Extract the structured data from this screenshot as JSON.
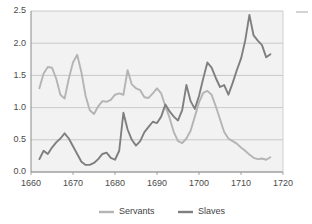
{
  "chart_data": {
    "type": "line",
    "title": "",
    "subtitle": "",
    "xlabel": "",
    "ylabel": "",
    "xlim": [
      1660,
      1720
    ],
    "ylim": [
      0.0,
      2.5
    ],
    "grid": true,
    "grid_axis": "y",
    "legend_position": "bottom",
    "plot_background": "#f2f2f2",
    "xticks": [
      1660,
      1670,
      1680,
      1690,
      1700,
      1710,
      1720
    ],
    "xtick_labels": [
      "1660",
      "1670",
      "1680",
      "1690",
      "1700",
      "1710",
      "1720"
    ],
    "yticks": [
      0.0,
      0.5,
      1.0,
      1.5,
      2.0,
      2.5
    ],
    "ytick_labels": [
      "0.0",
      "0.5",
      "1.0",
      "1.5",
      "2.0",
      "2.5"
    ],
    "series": [
      {
        "name": "Servants",
        "color": "#b4b4b4",
        "x": [
          1662,
          1663,
          1664,
          1665,
          1666,
          1667,
          1668,
          1669,
          1670,
          1671,
          1672,
          1673,
          1674,
          1675,
          1676,
          1677,
          1678,
          1679,
          1680,
          1681,
          1682,
          1683,
          1684,
          1685,
          1686,
          1687,
          1688,
          1689,
          1690,
          1691,
          1692,
          1693,
          1694,
          1695,
          1696,
          1697,
          1698,
          1699,
          1700,
          1701,
          1702,
          1703,
          1704,
          1705,
          1706,
          1707,
          1708,
          1709,
          1710,
          1711,
          1712,
          1713,
          1714,
          1715,
          1716,
          1717
        ],
        "values": [
          1.3,
          1.53,
          1.63,
          1.62,
          1.45,
          1.2,
          1.14,
          1.45,
          1.7,
          1.82,
          1.55,
          1.18,
          0.96,
          0.9,
          1.02,
          1.1,
          1.09,
          1.12,
          1.2,
          1.22,
          1.2,
          1.58,
          1.36,
          1.3,
          1.27,
          1.16,
          1.15,
          1.22,
          1.3,
          1.22,
          1.02,
          0.84,
          0.62,
          0.48,
          0.45,
          0.52,
          0.64,
          0.86,
          1.08,
          1.23,
          1.26,
          1.2,
          1.02,
          0.82,
          0.62,
          0.52,
          0.48,
          0.44,
          0.38,
          0.33,
          0.27,
          0.22,
          0.2,
          0.21,
          0.19,
          0.23
        ]
      },
      {
        "name": "Slaves",
        "color": "#7f7f7f",
        "x": [
          1662,
          1663,
          1664,
          1665,
          1666,
          1667,
          1668,
          1669,
          1670,
          1671,
          1672,
          1673,
          1674,
          1675,
          1676,
          1677,
          1678,
          1679,
          1680,
          1681,
          1682,
          1683,
          1684,
          1685,
          1686,
          1687,
          1688,
          1689,
          1690,
          1691,
          1692,
          1693,
          1694,
          1695,
          1696,
          1697,
          1698,
          1699,
          1700,
          1701,
          1702,
          1703,
          1704,
          1705,
          1706,
          1707,
          1708,
          1709,
          1710,
          1711,
          1712,
          1713,
          1714,
          1715,
          1716,
          1717
        ],
        "values": [
          0.2,
          0.33,
          0.28,
          0.38,
          0.46,
          0.52,
          0.6,
          0.52,
          0.4,
          0.28,
          0.16,
          0.11,
          0.11,
          0.14,
          0.2,
          0.28,
          0.3,
          0.22,
          0.19,
          0.33,
          0.92,
          0.66,
          0.5,
          0.41,
          0.48,
          0.62,
          0.7,
          0.78,
          0.76,
          0.86,
          1.05,
          0.94,
          0.86,
          0.8,
          0.96,
          1.35,
          1.1,
          0.98,
          1.18,
          1.45,
          1.7,
          1.62,
          1.46,
          1.32,
          1.35,
          1.2,
          1.38,
          1.58,
          1.76,
          2.04,
          2.44,
          2.12,
          2.04,
          1.97,
          1.78,
          1.83
        ]
      }
    ]
  },
  "legend": {
    "entries": [
      {
        "label": "Servants",
        "color": "#b4b4b4"
      },
      {
        "label": "Slaves",
        "color": "#7f7f7f"
      }
    ]
  },
  "corner_mark": {
    "color": "#c8c8c8"
  }
}
